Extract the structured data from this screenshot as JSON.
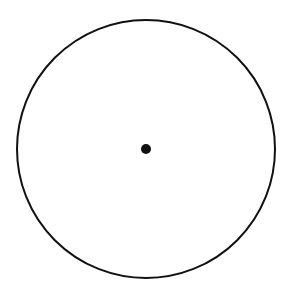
{
  "diagram": {
    "shapes": [
      {
        "type": "circle",
        "role": "outline",
        "stroke": "#111111",
        "fill": "none"
      },
      {
        "type": "point",
        "role": "center",
        "fill": "#111111"
      }
    ],
    "labels": []
  }
}
